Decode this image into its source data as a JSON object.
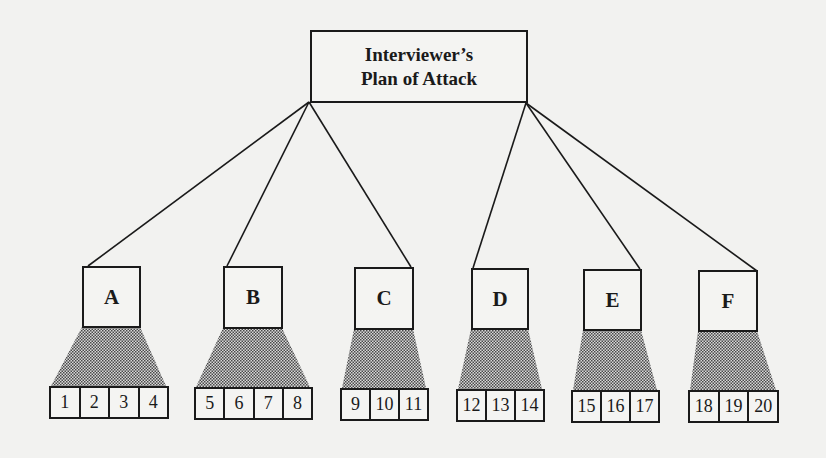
{
  "root": {
    "line1": "Interviewer’s",
    "line2": "Plan of Attack"
  },
  "colors": {
    "line": "#1a1a1a",
    "shade": "#7a7a7a",
    "background": "#f2f2f0"
  },
  "nodes": [
    {
      "label": "A",
      "leaves": [
        "1",
        "2",
        "3",
        "4"
      ]
    },
    {
      "label": "B",
      "leaves": [
        "5",
        "6",
        "7",
        "8"
      ]
    },
    {
      "label": "C",
      "leaves": [
        "9",
        "10",
        "11"
      ]
    },
    {
      "label": "D",
      "leaves": [
        "12",
        "13",
        "14"
      ]
    },
    {
      "label": "E",
      "leaves": [
        "15",
        "16",
        "17"
      ]
    },
    {
      "label": "F",
      "leaves": [
        "18",
        "19",
        "20"
      ]
    }
  ]
}
